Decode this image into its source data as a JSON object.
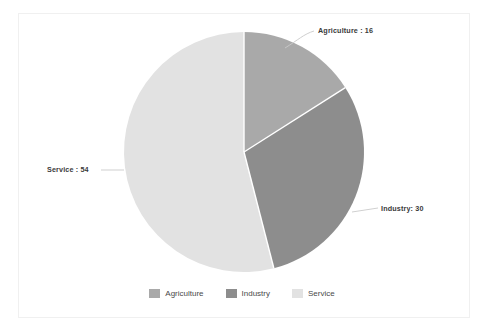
{
  "chart_data": {
    "type": "pie",
    "title": "",
    "subtitle": "",
    "xlabel": "",
    "ylabel": "",
    "grid": false,
    "legend_position": "bottom",
    "total": 100,
    "start_angle_deg": 0,
    "direction": "clockwise",
    "categories": [
      "Agriculture",
      "Industry",
      "Service"
    ],
    "values": [
      16,
      30,
      54
    ],
    "colors": [
      "#a9a9a9",
      "#8d8d8d",
      "#e2e2e2"
    ],
    "slices": [
      {
        "label": "Agriculture",
        "value": 16,
        "percent": 16,
        "angle_deg": 57.6,
        "color": "#a9a9a9",
        "data_label": "Agriculture : 16"
      },
      {
        "label": "Industry",
        "value": 30,
        "percent": 30,
        "angle_deg": 108,
        "color": "#8d8d8d",
        "data_label": "Industry: 30"
      },
      {
        "label": "Service",
        "value": 54,
        "percent": 54,
        "angle_deg": 194.4,
        "color": "#e2e2e2",
        "data_label": "Service : 54"
      }
    ],
    "annotations": [
      "Agriculture : 16",
      "Industry: 30",
      "Service : 54"
    ]
  },
  "labels": {
    "agriculture": "Agriculture : 16",
    "industry": "Industry: 30",
    "service": "Service : 54"
  },
  "legend": {
    "items": [
      {
        "label": "Agriculture",
        "color": "#a9a9a9"
      },
      {
        "label": "Industry",
        "color": "#8d8d8d"
      },
      {
        "label": "Service",
        "color": "#e2e2e2"
      }
    ]
  },
  "style": {
    "background": "#ffffff",
    "frame_border": "#f0f0f0",
    "label_text": "#3a3a3a",
    "legend_text": "#4a4a4a",
    "slice_separator": "#ffffff",
    "leader_line": "#cfcfcf"
  }
}
